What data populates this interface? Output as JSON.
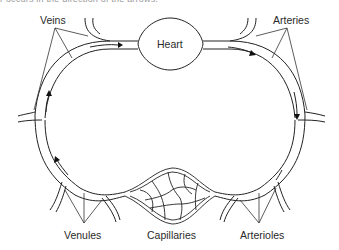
{
  "caption": "r occurs in the direction of the arrows.",
  "labels": {
    "heart": "Heart",
    "veins": "Veins",
    "arteries": "Arteries",
    "venules": "Venules",
    "capillaries": "Capillaries",
    "arterioles": "Arterioles"
  },
  "colors": {
    "line": "#222222",
    "text": "#2a2a2a",
    "background": "#ffffff"
  }
}
